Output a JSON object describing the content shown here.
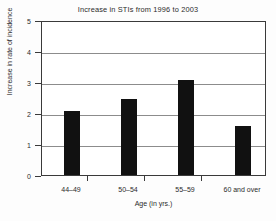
{
  "chart_data": {
    "type": "bar",
    "title": "Increase in STIs from 1996 to 2003",
    "xlabel": "Age (in yrs.)",
    "ylabel": "Increase in rate of incidence",
    "categories": [
      "44–49",
      "50–54",
      "55–59",
      "60 and over"
    ],
    "values": [
      2.1,
      2.5,
      3.1,
      1.6
    ],
    "ylim": [
      0,
      5
    ],
    "yticks": [
      0,
      1,
      2,
      3,
      4,
      5
    ],
    "ytick_labels": [
      "0",
      "1",
      "2",
      "3",
      "4",
      "5"
    ],
    "grid": "horizontal",
    "legend": "none",
    "bar_color": "#111111",
    "grid_color": "#8c8c8c",
    "axis_color": "#3a3a3a",
    "background_color": "#ffffff"
  }
}
